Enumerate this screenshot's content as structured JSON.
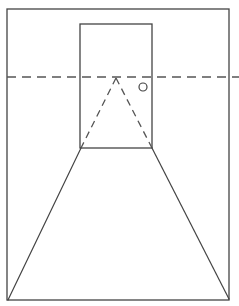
{
  "diagram": {
    "type": "one-point-perspective-sketch",
    "colors": {
      "background": "#ffffff",
      "stroke": "#444444",
      "dash_stroke": "#555555"
    },
    "frame": {
      "x1": 7,
      "y1": 9,
      "x2": 229,
      "y2": 300
    },
    "door": {
      "x1": 80,
      "y1": 24,
      "x2": 152,
      "y2": 148
    },
    "door_knob": {
      "cx": 143,
      "cy": 87,
      "r": 4
    },
    "horizon_line": {
      "y": 77,
      "x_start": 7,
      "x_end": 239,
      "dash": "9 6"
    },
    "vanishing_point": {
      "x": 116,
      "y": 78
    },
    "guide_lines": [
      {
        "from": [
          116,
          78
        ],
        "to": [
          81,
          148
        ],
        "style": "dashed"
      },
      {
        "from": [
          116,
          78
        ],
        "to": [
          152,
          148
        ],
        "style": "dashed"
      }
    ],
    "floor_lines": [
      {
        "from": [
          81,
          148
        ],
        "to": [
          8,
          300
        ],
        "style": "solid"
      },
      {
        "from": [
          152,
          148
        ],
        "to": [
          229,
          299
        ],
        "style": "solid"
      }
    ],
    "labels": []
  }
}
